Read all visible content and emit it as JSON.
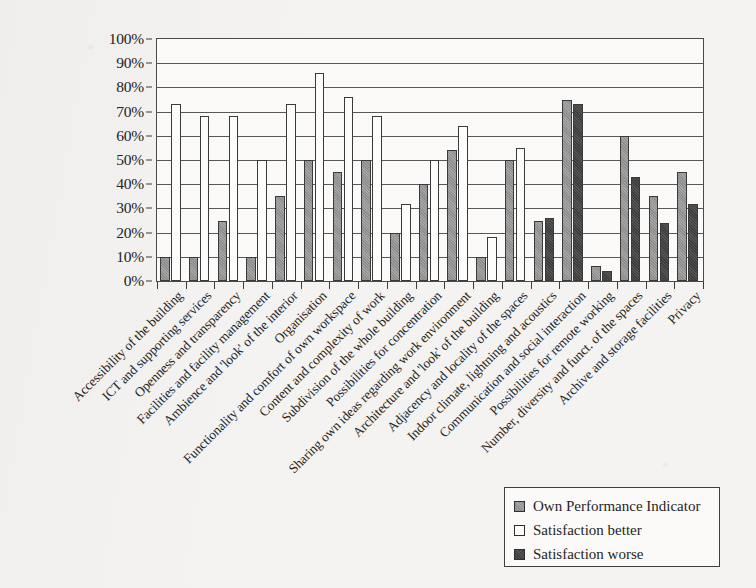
{
  "chart_data": {
    "type": "bar",
    "title": "",
    "subtitle": "",
    "xlabel": "",
    "ylabel": "",
    "ylim": [
      0,
      100
    ],
    "y_tick_labels": [
      "0%",
      "10%",
      "20%",
      "30%",
      "40%",
      "50%",
      "60%",
      "70%",
      "80%",
      "90%",
      "100%"
    ],
    "y_ticks": [
      0,
      10,
      20,
      30,
      40,
      50,
      60,
      70,
      80,
      90,
      100
    ],
    "grid": true,
    "grid_axis": "y",
    "legend_position": "bottom-right",
    "legend": [
      {
        "label": "Own Performance Indicator",
        "key": "own",
        "swatch": "medium-gray"
      },
      {
        "label": "Satisfaction better",
        "key": "better",
        "swatch": "white"
      },
      {
        "label": "Satisfaction worse",
        "key": "worse",
        "swatch": "dark-gray"
      }
    ],
    "categories": [
      "Accessibility of the building",
      "ICT and supporting services",
      "Openness and transparency",
      "Facilities and facility management",
      "Ambience and 'look' of the interior",
      "Organisation",
      "Functionality and comfort of own workspace",
      "Content and complexity of work",
      "Subdivision of the whole building",
      "Possibilities for concentration",
      "Sharing own ideas regarding work environment",
      "Architecture and 'look' of the building",
      "Adjacency and locality of the spaces",
      "Indoor climate, lightning and acoustics",
      "Communication and social interaction",
      "Possibilities for remote working",
      "Number, diversity and funct. of the spaces",
      "Archive and storage facilities",
      "Privacy"
    ],
    "series": [
      {
        "name": "Own Performance Indicator",
        "key": "own",
        "values": [
          10,
          10,
          25,
          10,
          35,
          50,
          45,
          50,
          20,
          40,
          54,
          10,
          50,
          25,
          75,
          6,
          60,
          35,
          45
        ]
      },
      {
        "name": "Satisfaction better",
        "key": "better",
        "values": [
          73,
          68,
          68,
          50,
          73,
          86,
          76,
          68,
          32,
          50,
          64,
          18,
          55,
          null,
          null,
          null,
          null,
          null,
          null
        ]
      },
      {
        "name": "Satisfaction worse",
        "key": "worse",
        "values": [
          null,
          null,
          null,
          null,
          null,
          null,
          null,
          null,
          null,
          null,
          null,
          null,
          null,
          26,
          73,
          4,
          43,
          24,
          32
        ]
      }
    ]
  }
}
